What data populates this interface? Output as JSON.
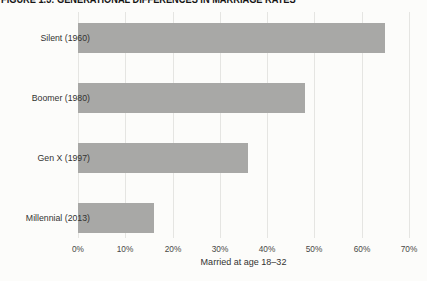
{
  "figure_title": "FIGURE 1.3: GENERATIONAL DIFFERENCES IN MARRIAGE RATES",
  "chart_data": {
    "type": "bar",
    "orientation": "horizontal",
    "title": "FIGURE 1.3: GENERATIONAL DIFFERENCES IN MARRIAGE RATES",
    "categories": [
      "Silent (1960)",
      "Boomer (1980)",
      "Gen X (1997)",
      "Millennial (2013)"
    ],
    "values": [
      65,
      48,
      36,
      16
    ],
    "xlabel": "Married at age 18–32",
    "ylabel": "",
    "xlim": [
      0,
      70
    ],
    "xticks_percent": [
      0,
      10,
      20,
      30,
      40,
      50,
      60,
      70
    ],
    "xtick_labels": [
      "0%",
      "10%",
      "20%",
      "30%",
      "40%",
      "50%",
      "60%",
      "70%"
    ],
    "grid": "vertical",
    "legend": "none",
    "colors": {
      "bar": "#a8a8a6",
      "gridline": "#e5e5e2",
      "tick_text": "#484846",
      "label_text": "#333331",
      "title_text": "#151515",
      "background": "#fcfcfa"
    }
  }
}
